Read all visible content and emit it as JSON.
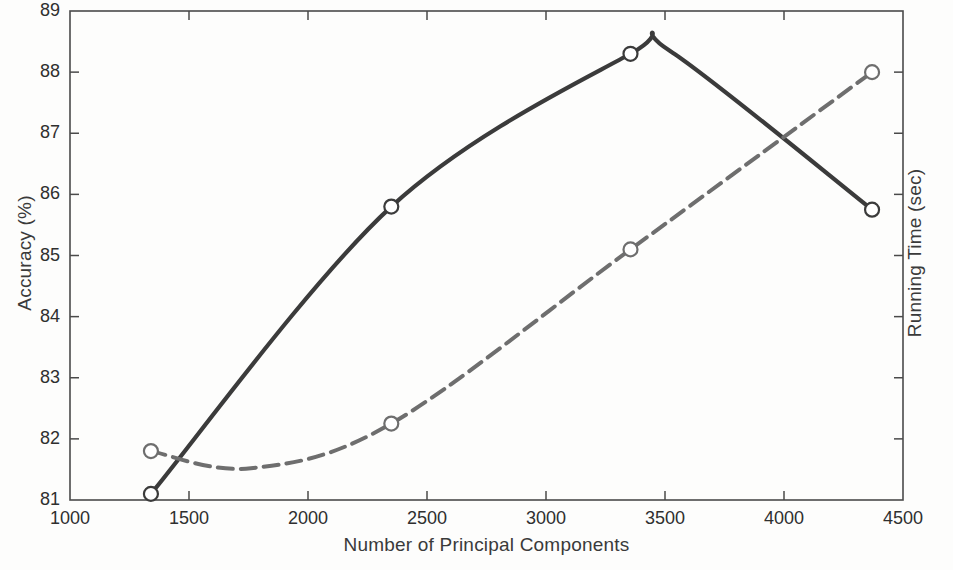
{
  "chart_data": {
    "type": "line",
    "title": "",
    "xlabel": "Number of Principal Components",
    "ylabel": "Accuracy (%)",
    "y2label": "Running Time (sec)",
    "xlim": [
      1000,
      4500
    ],
    "ylim": [
      81,
      89
    ],
    "xticks": [
      "1000",
      "1500",
      "2000",
      "2500",
      "3000",
      "3500",
      "4000",
      "4500"
    ],
    "yticks": [
      "81",
      "82",
      "83",
      "84",
      "85",
      "86",
      "87",
      "88",
      "89"
    ],
    "y2ticks": [
      "",
      "",
      "",
      "",
      "",
      "",
      "",
      "",
      ""
    ],
    "grid": false,
    "legend": "none",
    "series": [
      {
        "name": "Accuracy",
        "axis": "left",
        "style": "solid",
        "color": "#3b3b3b",
        "marker": "circle",
        "x": [
          1340,
          2350,
          3355,
          4370
        ],
        "values": [
          81.1,
          85.8,
          88.3,
          85.75
        ]
      },
      {
        "name": "Running Time",
        "axis": "right",
        "style": "dash-dot",
        "color": "#6e6e6e",
        "marker": "circle",
        "x": [
          1340,
          2350,
          3355,
          4370
        ],
        "values": [
          81.8,
          82.25,
          85.1,
          88.0
        ]
      }
    ]
  },
  "axes": {
    "left_title": "Accuracy (%)",
    "right_title": "Running Time (sec)",
    "bottom_title": "Number of Principal Components"
  },
  "ticks": {
    "y_left": [
      "89",
      "88",
      "87",
      "86",
      "85",
      "84",
      "83",
      "82",
      "81"
    ],
    "x_bottom": [
      "1000",
      "1500",
      "2000",
      "2500",
      "3000",
      "3500",
      "4000",
      "4500"
    ]
  },
  "colors": {
    "accuracy_line": "#3b3b3b",
    "running_time_line": "#6e6e6e",
    "frame": "#4a4a4a",
    "background": "#fdfdfc"
  }
}
